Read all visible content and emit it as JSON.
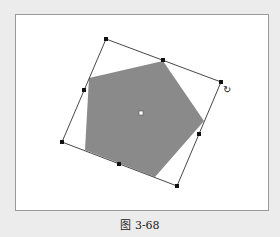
{
  "figure": {
    "caption": "图 3-68"
  },
  "canvas": {
    "background": "#ffffff",
    "shape": {
      "type": "pentagon",
      "fill": "#8a8a8a",
      "points": [
        [
          163,
          61
        ],
        [
          204,
          121
        ],
        [
          155,
          177
        ],
        [
          85,
          150
        ],
        [
          89,
          78
        ]
      ]
    },
    "bounding_box": {
      "stroke": "#333333",
      "corners": [
        [
          106,
          39
        ],
        [
          221,
          82
        ],
        [
          177,
          186
        ],
        [
          62,
          142
        ]
      ]
    },
    "handles": [
      {
        "name": "handle-top-left",
        "x": 106,
        "y": 39
      },
      {
        "name": "handle-top-middle",
        "x": 163,
        "y": 60
      },
      {
        "name": "handle-top-right",
        "x": 221,
        "y": 82
      },
      {
        "name": "handle-right-middle",
        "x": 199,
        "y": 134
      },
      {
        "name": "handle-bottom-right",
        "x": 177,
        "y": 186
      },
      {
        "name": "handle-bottom-middle",
        "x": 119,
        "y": 164
      },
      {
        "name": "handle-bottom-left",
        "x": 62,
        "y": 142
      },
      {
        "name": "handle-left-middle",
        "x": 84,
        "y": 90
      }
    ],
    "center_point": {
      "x": 141,
      "y": 113
    },
    "rotate_cursor": {
      "icon": "rotate-cursor-icon",
      "glyph": "↻",
      "x": 227,
      "y": 89
    }
  }
}
